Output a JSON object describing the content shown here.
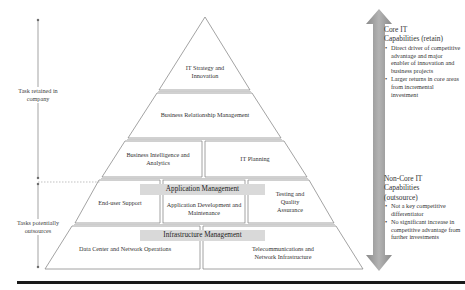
{
  "pyramid": {
    "tiers": [
      {
        "name": "tier-1",
        "cells": [
          {
            "label": "IT Strategy and Innovation"
          }
        ]
      },
      {
        "name": "tier-2",
        "cells": [
          {
            "label": "Business Relationship Management"
          }
        ]
      },
      {
        "name": "tier-3",
        "cells": [
          {
            "label": "Business Intelligence and Analytics"
          },
          {
            "label": "IT Planning"
          }
        ]
      },
      {
        "name": "tier-4",
        "banner": "Application Management",
        "cells": [
          {
            "label": "End-user Support"
          },
          {
            "label": "Application Development and Maintenance"
          },
          {
            "label": "Testing and Quality Assurance"
          }
        ]
      },
      {
        "name": "tier-5",
        "banner": "Infrastructure Management",
        "cells": [
          {
            "label": "Data Center and Network Operations"
          },
          {
            "label": "Telecommunications and Network Infrastructure"
          }
        ]
      }
    ]
  },
  "left_annotations": {
    "retained": "Task retained in company",
    "outsourced": "Tasks potentially outsources"
  },
  "right_panel": {
    "core": {
      "title_line1": "Core IT",
      "title_line2": "Capabilities (retain)",
      "bullets": [
        "Direct driver of competitive advantage and major enabler of innovation and business projects",
        "Larger returns in core areas from incremental investment"
      ]
    },
    "noncore": {
      "title_line1": "Non-Core IT",
      "title_line2": "Capabilities",
      "title_line3": "(outsource)",
      "bullets": [
        "Not a key competitive differentiator",
        "No significant increase in competitive advantage from further investments"
      ]
    }
  },
  "colors": {
    "arrow_fill": "#9a9a9a",
    "banner_fill": "#d9d9d9",
    "line": "#8c8c8c",
    "rule": "#1a1a1a"
  }
}
